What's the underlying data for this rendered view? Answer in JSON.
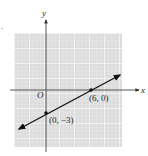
{
  "figure": {
    "fragment_label": ".",
    "axes": {
      "x_label": "x",
      "y_label": "y",
      "origin_label": "O"
    },
    "points": [
      {
        "label": "(6, 0)",
        "x": 6,
        "y": 0
      },
      {
        "label": "(0, −3)",
        "x": 0,
        "y": -3
      }
    ],
    "line": {
      "description": "line through (0, -3) and (6, 0)",
      "slope": 0.5,
      "y_intercept": -3
    },
    "colors": {
      "grid_fill": "#dcdcdc",
      "grid_line": "#ffffff",
      "axis": "#444444",
      "line": "#111111"
    }
  }
}
